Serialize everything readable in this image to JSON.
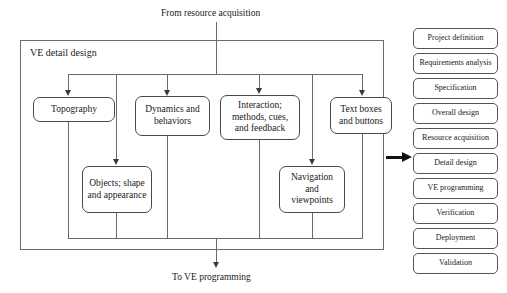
{
  "diagram": {
    "inlet_label": "From resource acquisition",
    "outlet_label": "To VE programming",
    "container_label": "VE detail design",
    "boxes": {
      "topography": "Topography",
      "dynamics": "Dynamics and behaviors",
      "interaction": "Interaction; methods, cues, and feedback",
      "textboxes": "Text boxes and buttons",
      "objects": "Objects; shape and appearance",
      "navigation": "Navigation and viewpoints"
    }
  },
  "sidebar": {
    "items": [
      {
        "label": "Project definition"
      },
      {
        "label": "Requirements analysis"
      },
      {
        "label": "Specification"
      },
      {
        "label": "Overall design"
      },
      {
        "label": "Resource acquisition"
      },
      {
        "label": "Detail design"
      },
      {
        "label": "VE programming"
      },
      {
        "label": "Verification"
      },
      {
        "label": "Deployment"
      },
      {
        "label": "Validation"
      }
    ],
    "highlighted": "Detail design"
  },
  "colors": {
    "line": "#6b6b6b",
    "box_border": "#4a4a4a",
    "arrow": "#111111",
    "background": "#ffffff"
  }
}
